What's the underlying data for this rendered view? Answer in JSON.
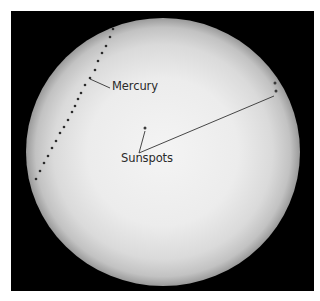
{
  "image": {
    "subject": "Solar disc with transit of Mercury and sunspots",
    "background_color": "#ffffff",
    "frame_color": "#000000",
    "disc_center_color": "#f2f2f2",
    "disc_limb_color": "#9a9a9a"
  },
  "labels": {
    "mercury": "Mercury",
    "sunspots": "Sunspots"
  },
  "disc": {
    "cx": 163,
    "cy": 152,
    "rx": 137,
    "ry": 134
  },
  "mercury_track": [
    [
      113,
      29
    ],
    [
      110,
      37
    ],
    [
      106,
      46
    ],
    [
      102,
      53
    ],
    [
      98,
      61
    ],
    [
      95,
      70
    ],
    [
      90,
      78
    ],
    [
      85,
      85
    ],
    [
      81,
      93
    ],
    [
      78,
      99
    ],
    [
      75,
      106
    ],
    [
      72,
      112
    ],
    [
      68,
      120
    ],
    [
      64,
      127
    ],
    [
      60,
      133
    ],
    [
      56,
      141
    ],
    [
      52,
      148
    ],
    [
      48,
      156
    ],
    [
      44,
      163
    ],
    [
      40,
      171
    ],
    [
      36,
      179
    ]
  ],
  "sunspots": [
    [
      145,
      128
    ],
    [
      275,
      83
    ],
    [
      276,
      91
    ]
  ],
  "leader_lines": {
    "mercury": [
      [
        90,
        79
      ],
      [
        110,
        88
      ]
    ],
    "sunspots_a": [
      [
        139,
        153
      ],
      [
        145,
        131
      ]
    ],
    "sunspots_b": [
      [
        139,
        153
      ],
      [
        274,
        96
      ]
    ]
  }
}
